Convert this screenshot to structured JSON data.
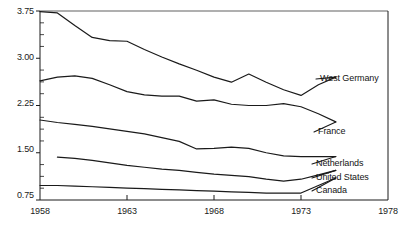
{
  "chart_data": {
    "type": "line",
    "title": "",
    "xlabel": "",
    "ylabel": "",
    "xlim": [
      1958,
      1978
    ],
    "ylim": [
      0.75,
      3.75
    ],
    "grid": false,
    "legend_position": "inline-right-labels",
    "y_ticks": [
      "0.75",
      "1.50",
      "2.25",
      "3.00",
      "3.75"
    ],
    "y_tick_values": [
      0.75,
      1.5,
      2.25,
      3.0,
      3.75
    ],
    "y_minor_tick_step": 0.1875,
    "x_ticks": [
      "1958",
      "1963",
      "1968",
      "1973",
      "1978"
    ],
    "x_tick_values": [
      1958,
      1963,
      1968,
      1973,
      1978
    ],
    "series": [
      {
        "name": "West Germany",
        "label": "West Germany",
        "color": "#1a1a1a",
        "x": [
          1958,
          1959,
          1960,
          1961,
          1962,
          1963,
          1964,
          1965,
          1966,
          1967,
          1968,
          1969,
          1970,
          1971,
          1972,
          1973,
          1974,
          1975
        ],
        "values": [
          3.74,
          3.72,
          3.52,
          3.33,
          3.28,
          3.27,
          3.14,
          3.02,
          2.91,
          2.81,
          2.7,
          2.62,
          2.75,
          2.62,
          2.5,
          2.41,
          2.58,
          2.7
        ]
      },
      {
        "name": "France",
        "label": "France",
        "color": "#1a1a1a",
        "x": [
          1958,
          1959,
          1960,
          1961,
          1962,
          1963,
          1964,
          1965,
          1966,
          1967,
          1968,
          1969,
          1970,
          1971,
          1972,
          1973,
          1974,
          1975
        ],
        "values": [
          2.64,
          2.7,
          2.72,
          2.68,
          2.58,
          2.47,
          2.42,
          2.4,
          2.4,
          2.32,
          2.34,
          2.27,
          2.25,
          2.25,
          2.28,
          2.23,
          2.12,
          1.99
        ]
      },
      {
        "name": "Netherlands",
        "label": "Netherlands",
        "color": "#1a1a1a",
        "x": [
          1958,
          1959,
          1960,
          1961,
          1962,
          1963,
          1964,
          1965,
          1966,
          1967,
          1968,
          1969,
          1970,
          1971,
          1972,
          1973,
          1974,
          1975
        ],
        "values": [
          2.02,
          1.98,
          1.95,
          1.92,
          1.88,
          1.84,
          1.8,
          1.74,
          1.68,
          1.56,
          1.57,
          1.59,
          1.57,
          1.5,
          1.45,
          1.44,
          1.44,
          1.44
        ]
      },
      {
        "name": "United States",
        "label": "United States",
        "color": "#1a1a1a",
        "x": [
          1959,
          1960,
          1961,
          1962,
          1963,
          1964,
          1965,
          1966,
          1967,
          1968,
          1969,
          1970,
          1971,
          1972,
          1973,
          1974,
          1975
        ],
        "values": [
          1.43,
          1.41,
          1.38,
          1.34,
          1.3,
          1.27,
          1.24,
          1.22,
          1.19,
          1.16,
          1.14,
          1.12,
          1.08,
          1.05,
          1.08,
          1.15,
          1.22
        ]
      },
      {
        "name": "Canada",
        "label": "Canada",
        "color": "#1a1a1a",
        "x": [
          1958,
          1959,
          1960,
          1961,
          1962,
          1963,
          1964,
          1965,
          1966,
          1967,
          1968,
          1969,
          1970,
          1971,
          1972,
          1973,
          1974,
          1975
        ],
        "values": [
          0.98,
          0.98,
          0.97,
          0.96,
          0.95,
          0.94,
          0.93,
          0.92,
          0.91,
          0.9,
          0.89,
          0.88,
          0.87,
          0.86,
          0.86,
          0.86,
          0.98,
          1.1
        ]
      }
    ],
    "series_labels": [
      {
        "name": "West Germany",
        "lx": 320,
        "ly": 82
      },
      {
        "name": "France",
        "lx": 318,
        "ly": 135
      },
      {
        "name": "Netherlands",
        "lx": 316,
        "ly": 167
      },
      {
        "name": "United States",
        "lx": 316,
        "ly": 181
      },
      {
        "name": "Canada",
        "lx": 316,
        "ly": 194
      }
    ]
  },
  "axes": {
    "axis_color": "#1a1a1a",
    "y_labels": [
      {
        "text": "3.75",
        "top": 6
      },
      {
        "text": "3.00",
        "top": 52
      },
      {
        "text": "2.25",
        "top": 98
      },
      {
        "text": "1.50",
        "top": 144
      },
      {
        "text": "0.75",
        "top": 190
      }
    ],
    "x_labels": [
      {
        "text": "1958",
        "left": 40
      },
      {
        "text": "1963",
        "left": 127
      },
      {
        "text": "1968",
        "left": 214
      },
      {
        "text": "1973",
        "left": 301
      },
      {
        "text": "1978",
        "left": 388
      }
    ]
  }
}
